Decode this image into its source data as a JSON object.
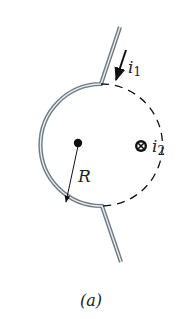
{
  "figure": {
    "caption": "(a)",
    "labels": {
      "current_1": "i",
      "current_1_sub": "1",
      "current_2": "i",
      "current_2_sub": "2",
      "radius": "R"
    },
    "colors": {
      "wire_outer": "#6e7a84",
      "wire_inner": "#e6ecf0",
      "ink": "#111111"
    },
    "geometry": {
      "center": [
        78,
        143
      ],
      "radius": 61,
      "top_junction": [
        101,
        84
      ],
      "bottom_junction": [
        102,
        206
      ],
      "top_lead_end": [
        120,
        27
      ],
      "bottom_lead_end": [
        121,
        262
      ],
      "out_of_page_symbol": [
        141,
        146
      ]
    }
  }
}
